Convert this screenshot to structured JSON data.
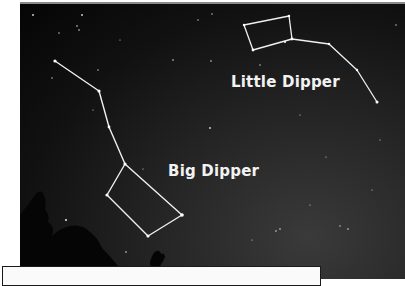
{
  "photo": {
    "subject": "night sky with constellations",
    "labels": {
      "little_dipper": "Little Dipper",
      "big_dipper": "Big Dipper"
    }
  },
  "constellations": {
    "big_dipper": {
      "name": "Big Dipper",
      "points": [
        [
          55,
          61
        ],
        [
          99,
          91
        ],
        [
          109,
          127
        ],
        [
          125,
          164
        ],
        [
          107,
          195
        ],
        [
          148,
          236
        ],
        [
          182,
          215
        ],
        [
          125,
          164
        ]
      ]
    },
    "little_dipper": {
      "name": "Little Dipper",
      "points": [
        [
          377,
          102
        ],
        [
          357,
          70
        ],
        [
          329,
          44
        ],
        [
          292,
          39
        ],
        [
          289,
          16
        ],
        [
          244,
          25
        ],
        [
          253,
          50
        ],
        [
          292,
          39
        ]
      ]
    }
  },
  "caption": {
    "text": ""
  }
}
